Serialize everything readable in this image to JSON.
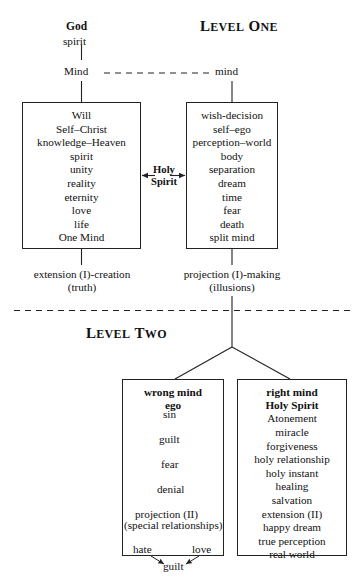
{
  "diagram": {
    "title_hidden": "",
    "levels": {
      "one": {
        "label_big": "L",
        "label_rest": "EVEL ",
        "label_big2": "O",
        "label_rest2": "NE",
        "full": "LEVEL ONE"
      },
      "two": {
        "label_big": "L",
        "label_rest": "EVEL ",
        "label_big2": "T",
        "label_rest2": "WO",
        "full": "LEVEL TWO"
      }
    },
    "source": {
      "god": "God",
      "spirit": "spirit",
      "mind_left": "Mind",
      "mind_right": "mind"
    },
    "left_box": {
      "items": [
        "Will",
        "Self–Christ",
        "knowledge–Heaven",
        "spirit",
        "unity",
        "reality",
        "eternity",
        "love",
        "life",
        "One Mind"
      ]
    },
    "right_box": {
      "items": [
        "wish-decision",
        "self–ego",
        "perception–world",
        "body",
        "separation",
        "dream",
        "time",
        "fear",
        "death",
        "split mind"
      ]
    },
    "bridge": {
      "line1": "Holy",
      "line2": "Spirit"
    },
    "captions": {
      "left_line1": "extension (I)-creation",
      "left_line2": "(truth)",
      "right_line1": "projection (I)-making",
      "right_line2": "(illusions)"
    },
    "wrong_mind_box": {
      "header1": "wrong mind",
      "header2": "ego",
      "chain": [
        "sin",
        "guilt",
        "fear",
        "denial"
      ],
      "projection1": "projection (II)",
      "projection2": "(special relationships)",
      "branch_left": "hate",
      "branch_right": "love",
      "result": "guilt"
    },
    "right_mind_box": {
      "header1": "right mind",
      "header2": "Holy Spirit",
      "items": [
        "Atonement",
        "miracle",
        "forgiveness",
        "holy relationship",
        "holy instant",
        "healing",
        "salvation",
        "extension (II)",
        "happy dream",
        "true perception",
        "real world"
      ]
    },
    "colors": {
      "ink": "#111111",
      "stroke": "#222222",
      "background": "#ffffff"
    }
  }
}
